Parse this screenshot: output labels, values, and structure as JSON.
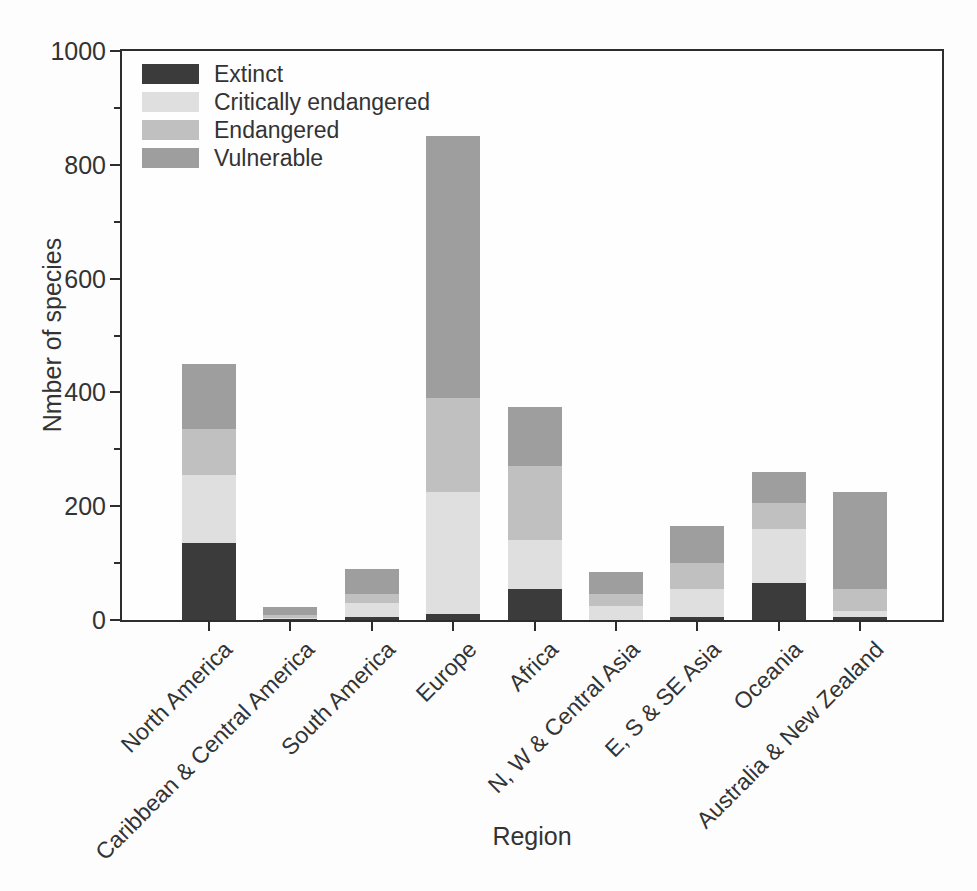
{
  "chart_data": {
    "type": "bar",
    "stacked": true,
    "title": "",
    "xlabel": "Region",
    "ylabel": "Nmber of species",
    "ylim": [
      0,
      1000
    ],
    "yticks": [
      0,
      200,
      400,
      600,
      800,
      1000
    ],
    "yminorticks": [
      100,
      300,
      500,
      700,
      900
    ],
    "grid": false,
    "legend_position": "upper-left-inside",
    "axis_color": "#2d2d2d",
    "text_color": "#333333",
    "categories": [
      "North America",
      "Caribbean & Central America",
      "South America",
      "Europe",
      "Africa",
      "N, W & Central Asia",
      "E, S & SE Asia",
      "Oceania",
      "Australia & New Zealand"
    ],
    "series": [
      {
        "name": "Extinct",
        "color": "#3b3b3b",
        "values": [
          135,
          1,
          5,
          10,
          55,
          0,
          5,
          65,
          5
        ]
      },
      {
        "name": "Critically endangered",
        "color": "#dfdfdf",
        "values": [
          120,
          3,
          25,
          215,
          85,
          25,
          50,
          95,
          10
        ]
      },
      {
        "name": "Endangered",
        "color": "#c0c0c0",
        "values": [
          80,
          4,
          15,
          165,
          130,
          20,
          45,
          45,
          40
        ]
      },
      {
        "name": "Vulnerable",
        "color": "#9e9e9e",
        "values": [
          115,
          14,
          45,
          460,
          105,
          40,
          65,
          55,
          170
        ]
      }
    ]
  }
}
